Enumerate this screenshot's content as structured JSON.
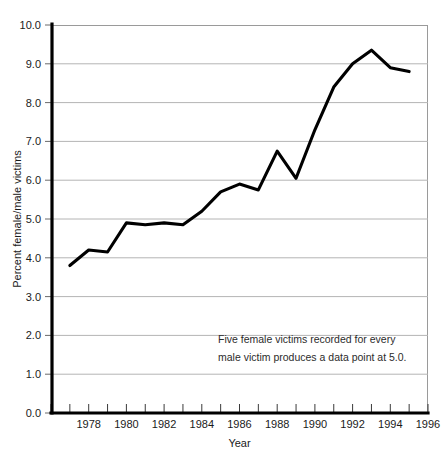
{
  "figure": {
    "background_color": "#ffffff",
    "line_color": "#000000",
    "grid_color": "#b4b4b4",
    "axis_color": "#000000"
  },
  "axes": {
    "y_title": "Percent female/male victims",
    "x_title": "Year",
    "y_tick_labels": [
      "0.0",
      "1.0",
      "2.0",
      "3.0",
      "4.0",
      "5.0",
      "6.0",
      "7.0",
      "8.0",
      "9.0",
      "10.0"
    ],
    "x_tick_labels": [
      "1978",
      "1980",
      "1982",
      "1984",
      "1986",
      "1988",
      "1990",
      "1992",
      "1994",
      "1996"
    ]
  },
  "annotation": {
    "line1": "Five female victims recorded for every",
    "line2": "male victim produces a data point at 5.0."
  },
  "chart_data": {
    "type": "line",
    "title": "",
    "subtitle": "",
    "xlabel": "Year",
    "ylabel": "Percent female/male victims",
    "xlim": [
      1976,
      1996
    ],
    "ylim": [
      0.0,
      10.0
    ],
    "grid": true,
    "grid_axis": "y",
    "legend": false,
    "legend_position": "none",
    "y_ticks": [
      0.0,
      1.0,
      2.0,
      3.0,
      4.0,
      5.0,
      6.0,
      7.0,
      8.0,
      9.0,
      10.0
    ],
    "x_ticks": [
      1976,
      1977,
      1978,
      1979,
      1980,
      1981,
      1982,
      1983,
      1984,
      1985,
      1986,
      1987,
      1988,
      1989,
      1990,
      1991,
      1992,
      1993,
      1994,
      1995,
      1996
    ],
    "x_tick_labels_shown": [
      1978,
      1980,
      1982,
      1984,
      1986,
      1988,
      1990,
      1992,
      1994,
      1996
    ],
    "x": [
      1977,
      1978,
      1979,
      1980,
      1981,
      1982,
      1983,
      1984,
      1985,
      1986,
      1987,
      1988,
      1989,
      1990,
      1991,
      1992,
      1993,
      1994,
      1995
    ],
    "values": [
      3.8,
      4.2,
      4.15,
      4.9,
      4.85,
      4.9,
      4.85,
      5.2,
      5.7,
      5.9,
      5.75,
      6.75,
      6.05,
      7.3,
      8.4,
      9.0,
      9.35,
      8.9,
      8.8
    ],
    "series": [
      {
        "name": "Percent female/male victims",
        "values": [
          3.8,
          4.2,
          4.15,
          4.9,
          4.85,
          4.9,
          4.85,
          5.2,
          5.7,
          5.9,
          5.75,
          6.75,
          6.05,
          7.3,
          8.4,
          9.0,
          9.35,
          8.9,
          8.8
        ]
      }
    ],
    "annotations": [
      {
        "text": "Five female victims recorded for every male victim produces a data point at 5.0.",
        "x": 1986.2,
        "y": 1.95
      }
    ]
  }
}
